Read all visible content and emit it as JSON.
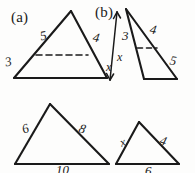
{
  "figure": {
    "background_color": "#fdfdfc",
    "ink_color": "#1a1a1a",
    "parts": [
      {
        "id": "a",
        "label": "(a)"
      },
      {
        "id": "b",
        "label": "(b)"
      }
    ],
    "triangles": [
      {
        "id": "a-large",
        "name": "part-a-large-triangle",
        "part": "a",
        "labels": {
          "left": "5",
          "right": "4",
          "lower_left": "3",
          "lower_right": "x"
        },
        "has_dashed_line": true
      },
      {
        "id": "b-large",
        "name": "part-b-large-triangle",
        "part": "b",
        "labels": {
          "upper_right": "4",
          "lower_right": "5",
          "arrow_upper": "3",
          "arrow_lower": "x"
        },
        "has_dashed_line": true,
        "has_double_arrow": true
      },
      {
        "id": "bottom-left",
        "name": "bottom-left-triangle",
        "labels": {
          "left": "6",
          "right": "8",
          "base": "10"
        },
        "has_dashed_line": false
      },
      {
        "id": "bottom-right",
        "name": "bottom-right-triangle",
        "labels": {
          "left": "x",
          "right": "4",
          "base": "6"
        },
        "has_dashed_line": false
      }
    ]
  },
  "annotations": {
    "part_a": "(a)",
    "part_b": "(b)",
    "a_left_side": "5",
    "a_right_side": "4",
    "a_lower_left_side": "3",
    "a_lower_right_side": "x",
    "b_arrow_top": "3",
    "b_arrow_bottom": "x",
    "b_upper_right_side": "4",
    "b_lower_right_side": "5",
    "bl_left_side": "6",
    "bl_right_side": "8",
    "bl_base": "10",
    "br_left_side": "x",
    "br_right_side": "4",
    "br_base": "6"
  }
}
